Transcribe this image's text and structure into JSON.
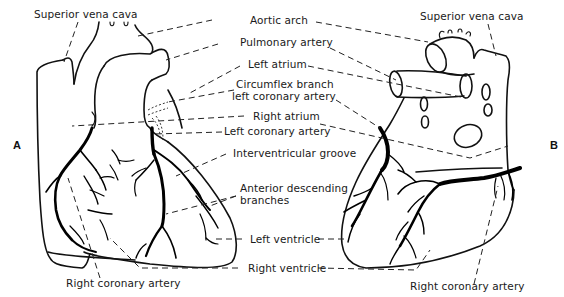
{
  "figure": {
    "panels": [
      {
        "id": "A",
        "label": "A",
        "view": "anterior"
      },
      {
        "id": "B",
        "label": "B",
        "view": "posterior"
      }
    ],
    "labels": {
      "superior_vena_cava_left": "Superior vena cava",
      "superior_vena_cava_right": "Superior vena cava",
      "aortic_arch": "Aortic arch",
      "pulmonary_artery": "Pulmonary artery",
      "left_atrium": "Left atrium",
      "circumflex_line1": "Circumflex branch",
      "circumflex_line2": "left coronary artery",
      "right_atrium": "Right atrium",
      "left_coronary_artery": "Left coronary artery",
      "interventricular_groove": "Interventricular groove",
      "anterior_descending_line1": "Anterior descending",
      "anterior_descending_line2": "branches",
      "left_ventricle": "Left ventricle",
      "right_ventricle": "Right ventricle",
      "right_coronary_artery_left": "Right coronary artery",
      "right_coronary_artery_right": "Right coronary artery"
    },
    "colors": {
      "ink": "#111111",
      "background": "#ffffff"
    }
  }
}
